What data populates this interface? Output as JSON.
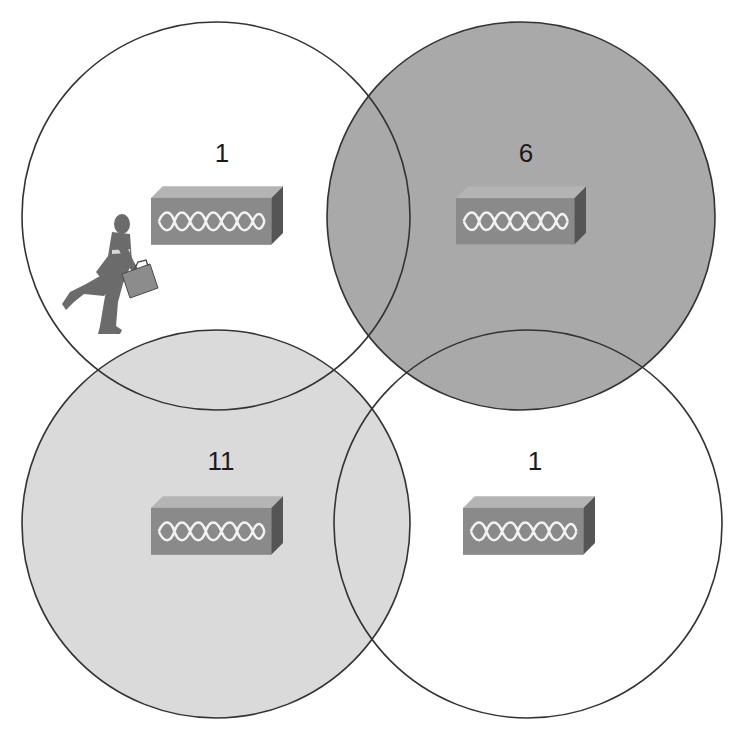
{
  "colors": {
    "white_cell": "#ffffff",
    "dark_cell": "#a9a9a9",
    "light_cell": "#dadada",
    "outline": "#333333",
    "ap_front": "#8a8a8a",
    "ap_top": "#b4b4b4",
    "ap_side": "#555555",
    "person": "#6b6b6b"
  },
  "cells": [
    {
      "id": "top-left",
      "channel": "1",
      "fill": "white_cell",
      "has_user": true
    },
    {
      "id": "top-right",
      "channel": "6",
      "fill": "dark_cell",
      "has_user": false
    },
    {
      "id": "bottom-left",
      "channel": "11",
      "fill": "light_cell",
      "has_user": false
    },
    {
      "id": "bottom-right",
      "channel": "1",
      "fill": "white_cell",
      "has_user": false
    }
  ],
  "icons": {
    "access_point": "access-point-icon",
    "user": "running-businessman-icon"
  }
}
